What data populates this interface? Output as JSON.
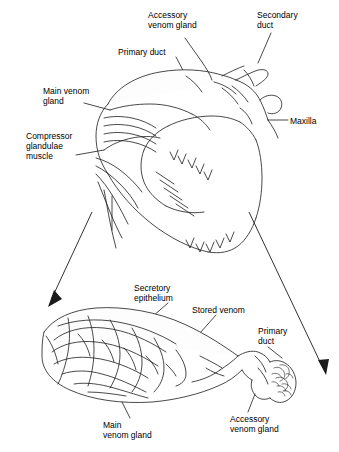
{
  "figure": {
    "background_color": "#ffffff",
    "line_color": "#1a1a1a",
    "labels": [
      {
        "id": "accessory_venom_gland_top",
        "text": "Accessory\nvenom gland",
        "x": 148,
        "y": 10,
        "align": "left"
      },
      {
        "id": "secondary_duct",
        "text": "Secondary\nduct",
        "x": 257,
        "y": 10,
        "align": "left"
      },
      {
        "id": "primary_duct_top",
        "text": "Primary duct",
        "x": 118,
        "y": 47,
        "align": "left"
      },
      {
        "id": "main_venom_gland_top",
        "text": "Main venom\ngland",
        "x": 43,
        "y": 86,
        "align": "left"
      },
      {
        "id": "maxilla",
        "text": "Maxilla",
        "x": 290,
        "y": 116,
        "align": "left"
      },
      {
        "id": "compressor_glandulae_muscle",
        "text": "Compressor\nglandulae\nmuscle",
        "x": 26,
        "y": 131,
        "align": "left"
      },
      {
        "id": "secretory_epithelium",
        "text": "Secretory\nepithelium",
        "x": 134,
        "y": 283,
        "align": "left"
      },
      {
        "id": "stored_venom",
        "text": "Stored venom",
        "x": 192,
        "y": 305,
        "align": "left"
      },
      {
        "id": "primary_duct_bottom",
        "text": "Primary\nduct",
        "x": 258,
        "y": 326,
        "align": "left"
      },
      {
        "id": "main_venom_gland_bottom",
        "text": "Main\nvenom gland",
        "x": 103,
        "y": 420,
        "align": "left"
      },
      {
        "id": "accessory_venom_gland_bottom",
        "text": "Accessory\nvenom gland",
        "x": 230,
        "y": 414,
        "align": "left"
      }
    ]
  }
}
